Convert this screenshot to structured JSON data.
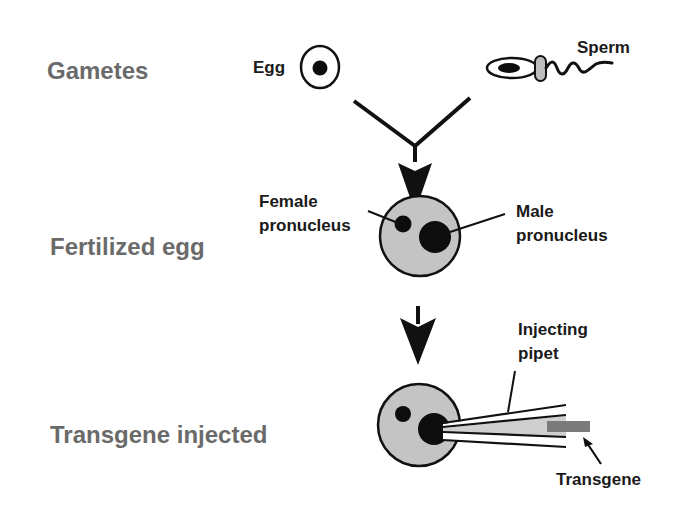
{
  "stages": [
    {
      "label": "Gametes"
    },
    {
      "label": "Fertilized egg"
    },
    {
      "label": "Transgene injected"
    }
  ],
  "callouts": {
    "egg": "Egg",
    "sperm": "Sperm",
    "female_pronucleus": [
      "Female",
      "pronucleus"
    ],
    "male_pronucleus": [
      "Male",
      "pronucleus"
    ],
    "injecting_pipet": [
      "Injecting",
      "pipet"
    ],
    "transgene": "Transgene"
  },
  "colors": {
    "stage_label": "#6a6a6a",
    "outline": "#111111",
    "cytoplasm": "#c4c4c4",
    "pronucleus": "#0d0d0d",
    "midpiece": "#bdbdbd",
    "pipet_fill": "#cfcfcf",
    "transgene": "#7a7a7a"
  },
  "icons": [
    "egg-cell-icon",
    "sperm-cell-icon",
    "merge-arrow-icon",
    "down-arrow-icon",
    "injecting-pipet-icon"
  ]
}
